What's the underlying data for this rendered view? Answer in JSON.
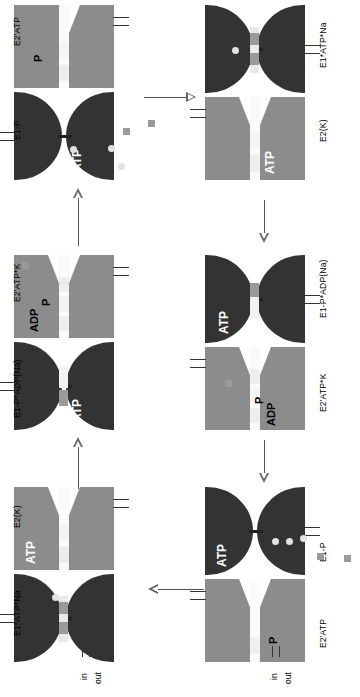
{
  "figure": {
    "orientation": "rotated-90-ccw",
    "colors": {
      "protein_open_gray": "#8c8c8c",
      "protein_closed_dark": "#333333",
      "membrane_slot": "#f2f2f2",
      "k_ion": "#9a9a9a",
      "na_ion": "#e2e2e2",
      "arrow": "#555555",
      "background": "#ffffff"
    }
  },
  "axis": {
    "in_label": "in",
    "out_label": "out"
  },
  "states": [
    {
      "id": "e1-atp-na",
      "name": "E1*ATP*Na",
      "conformation_top": "gray-open",
      "conformation_bottom": "dark-closed",
      "ligands": [
        "ATP"
      ],
      "inline_labels": [
        "ATP"
      ]
    },
    {
      "id": "e2-k",
      "name": "E2(K)",
      "conformation_top": "dark-closed",
      "conformation_bottom": "dark-closed",
      "ligands": [],
      "inline_labels": []
    },
    {
      "id": "e1-p-adp-na",
      "name": "E1-P*ADP(Na)",
      "conformation_top": "gray-open",
      "conformation_bottom": "gray-open",
      "ligands": [
        "ADP",
        "P"
      ],
      "inline_labels": [
        "ADP",
        "P"
      ]
    },
    {
      "id": "e2-atp-k",
      "name": "E2'ATP*K",
      "conformation_top": "dark-closed",
      "conformation_bottom": "dark-closed",
      "ligands": [
        "ATP"
      ],
      "inline_labels": [
        "ATP"
      ]
    },
    {
      "id": "e1-p",
      "name": "E1-P",
      "conformation_top": "gray-open",
      "conformation_bottom": "gray-open",
      "ligands": [
        "P"
      ],
      "inline_labels": [
        "P"
      ]
    },
    {
      "id": "e2-atp",
      "name": "E2'ATP",
      "conformation_top": "dark-closed",
      "conformation_bottom": "dark-closed",
      "ligands": [
        "ATP"
      ],
      "inline_labels": [
        "ATP"
      ]
    }
  ],
  "inline_text": {
    "atp": "ATP",
    "adp": "ADP",
    "p": "P"
  },
  "arrows": [
    {
      "id": "arrow-1",
      "direction": "right",
      "from": "e2-atp-cell",
      "to": "e1-atp-na-cell"
    },
    {
      "id": "arrow-2",
      "direction": "down",
      "from": "e2-k-cell",
      "to": "e1-p-adp-na-cell"
    },
    {
      "id": "arrow-3",
      "direction": "down",
      "from": "e2-atp-k-cell",
      "to": "e1-p-cell"
    },
    {
      "id": "arrow-4",
      "direction": "left",
      "from": "e1-p-cell",
      "to": "e2-atp-k-right"
    },
    {
      "id": "arrow-5",
      "direction": "up",
      "from": "e2-atp-k-left",
      "to": "e1-p-left"
    },
    {
      "id": "arrow-6",
      "direction": "up",
      "from": "e1-atp-na-left",
      "to": "e2-atp-k-left"
    }
  ],
  "ions": {
    "k_label": "K+",
    "na_label": "Na+",
    "k_count_visible": 5,
    "na_count_visible": 6
  }
}
